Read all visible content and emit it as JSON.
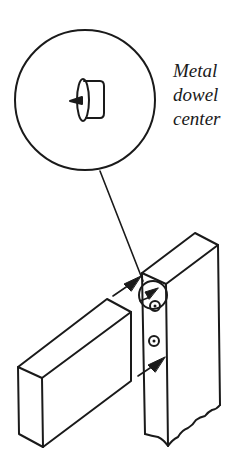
{
  "diagram": {
    "callout_label": [
      "Metal",
      "dowel",
      "center"
    ],
    "colors": {
      "ink": "#1a1a1a",
      "background": "#ffffff"
    },
    "parts": {
      "magnified_view": "circle-inset",
      "magnified_item": "metal-dowel-center",
      "boards": [
        "horizontal-rail",
        "vertical-stile"
      ],
      "holes": 2,
      "arrows": 3
    }
  }
}
